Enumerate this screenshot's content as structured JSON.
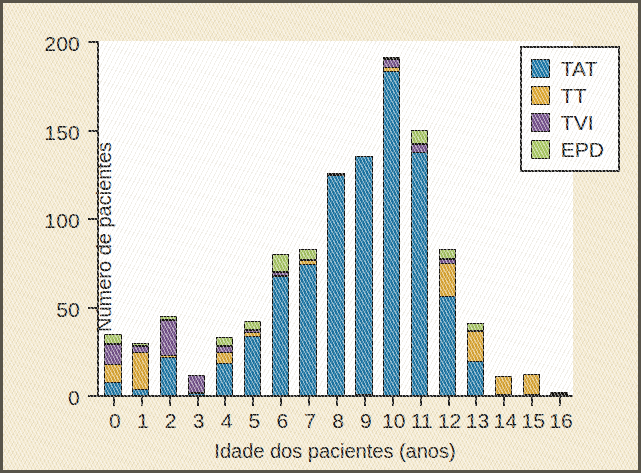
{
  "figure": {
    "background_color": "#f4ead0",
    "plot_background_color": "#ffffff",
    "frame_color": "#58544a"
  },
  "chart_data": {
    "type": "bar",
    "subtype": "stacked-bar",
    "title": "",
    "xlabel": "Idade dos pacientes (anos)",
    "ylabel": "Número de pacientes",
    "categories": [
      "0",
      "1",
      "2",
      "3",
      "4",
      "5",
      "6",
      "7",
      "8",
      "9",
      "10",
      "11",
      "12",
      "13",
      "14",
      "15",
      "16"
    ],
    "ylim": [
      0,
      200
    ],
    "yticks": [
      0,
      50,
      100,
      150,
      200
    ],
    "ytick_labels": [
      "0",
      "50",
      "100",
      "150",
      "200"
    ],
    "xticks": [
      0,
      1,
      2,
      3,
      4,
      5,
      6,
      7,
      8,
      9,
      10,
      11,
      12,
      13,
      14,
      15,
      16
    ],
    "grid": false,
    "legend_position": "top-right",
    "series": [
      {
        "name": "TAT",
        "color": "#1b77a8",
        "values": [
          8,
          4,
          22,
          2,
          19,
          34,
          68,
          75,
          125,
          135,
          184,
          138,
          57,
          20,
          0,
          0,
          1
        ]
      },
      {
        "name": "TT",
        "color": "#dda834",
        "values": [
          11,
          22,
          2,
          0,
          7,
          3,
          1,
          3,
          1,
          0,
          3,
          1,
          19,
          18,
          11,
          12,
          1
        ]
      },
      {
        "name": "TVI",
        "color": "#74518c",
        "values": [
          12,
          4,
          21,
          10,
          4,
          2,
          3,
          0,
          0,
          0,
          5,
          5,
          3,
          0,
          0,
          0,
          0
        ]
      },
      {
        "name": "EPD",
        "color": "#a7c763",
        "values": [
          6,
          2,
          2,
          0,
          5,
          5,
          10,
          6,
          0,
          0,
          1,
          8,
          6,
          4,
          0,
          0,
          0
        ]
      }
    ],
    "totals": [
      37,
      32,
      47,
      12,
      35,
      44,
      82,
      84,
      126,
      135,
      193,
      152,
      85,
      42,
      11,
      12,
      2
    ]
  },
  "legend": {
    "entries": [
      {
        "label": "TAT",
        "color": "#1b77a8"
      },
      {
        "label": "TT",
        "color": "#dda834"
      },
      {
        "label": "TVI",
        "color": "#74518c"
      },
      {
        "label": "EPD",
        "color": "#a7c763"
      }
    ]
  }
}
